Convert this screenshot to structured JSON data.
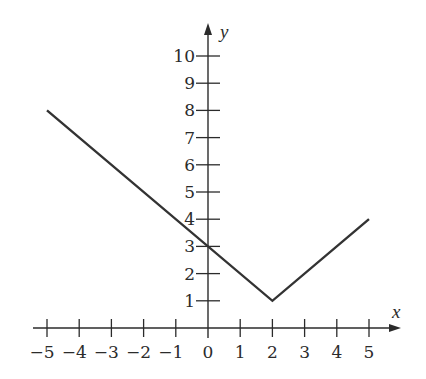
{
  "chart_data": {
    "type": "line",
    "title": "",
    "xlabel": "x",
    "ylabel": "y",
    "xlim": [
      -5,
      5
    ],
    "ylim": [
      0,
      10
    ],
    "grid": false,
    "legend": null,
    "x_ticks": [
      -5,
      -4,
      -3,
      -2,
      -1,
      0,
      1,
      2,
      3,
      4,
      5
    ],
    "x_tick_labels": [
      "−5",
      "−4",
      "−3",
      "−2",
      "−1",
      "0",
      "1",
      "2",
      "3",
      "4",
      "5"
    ],
    "y_ticks": [
      1,
      2,
      3,
      4,
      5,
      6,
      7,
      8,
      9,
      10
    ],
    "y_tick_labels": [
      "1",
      "2",
      "3",
      "4",
      "5",
      "6",
      "7",
      "8",
      "9",
      "10"
    ],
    "series": [
      {
        "name": "y = |x − 2| + 1",
        "x": [
          -5,
          2,
          5
        ],
        "y": [
          8,
          1,
          4
        ],
        "color": "#333333"
      }
    ]
  },
  "layout": {
    "origin_px": [
      208,
      328
    ],
    "x_unit_px": 32.2,
    "y_unit_px": 27.2,
    "x_axis_start_px": 33,
    "x_axis_end_px": 401,
    "y_axis_top_px": 23,
    "axis_color": "#2b2b2b"
  }
}
